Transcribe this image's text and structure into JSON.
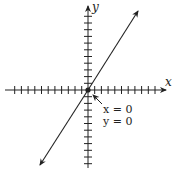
{
  "diagram": {
    "type": "coordinate-plane-line",
    "axes": {
      "x_label": "x",
      "y_label": "y",
      "x_ticks_left": 11,
      "x_ticks_right": 10,
      "y_ticks_up": 10,
      "y_ticks_down": 10
    },
    "line": {
      "description": "line through the origin with positive slope, arrows on both ends"
    },
    "annotation": {
      "line1": "x = 0",
      "line2": "y = 0",
      "points_to": "origin"
    },
    "colors": {
      "ink": "#222222",
      "background": "#ffffff"
    }
  }
}
